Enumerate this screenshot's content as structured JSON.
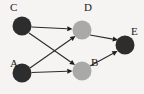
{
  "figure": {
    "width": 144,
    "height": 94,
    "background_color": "#f5f4f2"
  },
  "chart_data": {
    "type": "diagram",
    "diagram_kind": "directed-graph",
    "title": "",
    "node_count": 5,
    "edge_count": 6,
    "colors": {
      "background": "#f5f4f2",
      "node_dark": "#2a2a2a",
      "node_gray": "#a8a8a8",
      "edge": "#2b2b2b",
      "arrowhead": "#1d1d1d",
      "label": "#1a1a1a"
    },
    "nodes": [
      {
        "id": "C",
        "label": "C",
        "fill": "#2d2d2d",
        "shade": "dark",
        "cx": 22,
        "cy": 26,
        "r": 9.5,
        "label_x": 10,
        "label_y": 8
      },
      {
        "id": "D",
        "label": "D",
        "fill": "#a9a9a9",
        "shade": "gray",
        "cx": 82,
        "cy": 30,
        "r": 9.5,
        "label_x": 84,
        "label_y": 8
      },
      {
        "id": "A",
        "label": "A",
        "fill": "#2d2d2d",
        "shade": "dark",
        "cx": 22,
        "cy": 73,
        "r": 9.5,
        "label_x": 10,
        "label_y": 64
      },
      {
        "id": "B",
        "label": "B",
        "fill": "#a9a9a9",
        "shade": "gray",
        "cx": 82,
        "cy": 71,
        "r": 9.5,
        "label_x": 91,
        "label_y": 63
      },
      {
        "id": "E",
        "label": "E",
        "fill": "#2d2d2d",
        "shade": "dark",
        "cx": 125,
        "cy": 45,
        "r": 9.5,
        "label_x": 131,
        "label_y": 32
      }
    ],
    "edges": [
      {
        "id": "C-D",
        "from": "C",
        "to": "D",
        "directed": true,
        "x1": 31.5,
        "y1": 27,
        "x2": 72.5,
        "y2": 29
      },
      {
        "id": "C-B",
        "from": "C",
        "to": "B",
        "directed": true,
        "x1": 29,
        "y1": 33,
        "x2": 75,
        "y2": 65
      },
      {
        "id": "A-D",
        "from": "A",
        "to": "D",
        "directed": true,
        "x1": 30,
        "y1": 68,
        "x2": 75.5,
        "y2": 36
      },
      {
        "id": "A-B",
        "from": "A",
        "to": "B",
        "directed": true,
        "x1": 31.5,
        "y1": 72.5,
        "x2": 72.5,
        "y2": 71
      },
      {
        "id": "D-E",
        "from": "D",
        "to": "E",
        "directed": true,
        "x1": 90,
        "y1": 35,
        "x2": 118,
        "y2": 40
      },
      {
        "id": "B-E",
        "from": "B",
        "to": "E",
        "directed": true,
        "x1": 90,
        "y1": 66,
        "x2": 117.5,
        "y2": 51
      }
    ]
  }
}
